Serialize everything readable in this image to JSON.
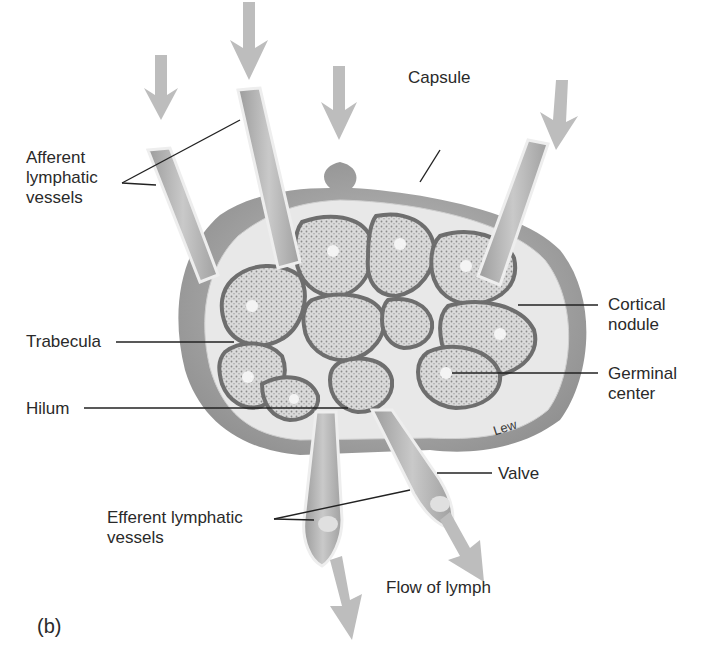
{
  "figure": {
    "panel_label": "(b)",
    "artist_signature": "Lew",
    "colors": {
      "background": "#ffffff",
      "capsule_outer": "#a9a9a9",
      "capsule_inner": "#e6e6e6",
      "nodule_fill": "#d4d4d4",
      "nodule_border": "#6e6e6e",
      "arrow": "#bdbdbd",
      "leader_line": "#222222",
      "text": "#2a2a2a"
    },
    "labels": {
      "afferent": "Afferent\nlymphatic\nvessels",
      "capsule": "Capsule",
      "cortical_nodule": "Cortical\nnodule",
      "trabecula": "Trabecula",
      "germinal_center": "Germinal\ncenter",
      "hilum": "Hilum",
      "valve": "Valve",
      "efferent": "Efferent lymphatic\nvessels",
      "flow": "Flow of lymph"
    },
    "arrows": {
      "afferent_count": 4,
      "efferent_count": 2
    }
  }
}
